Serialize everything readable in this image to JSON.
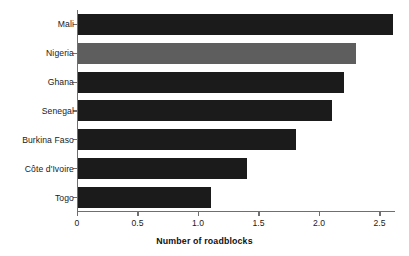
{
  "chart_data": {
    "type": "bar",
    "orientation": "horizontal",
    "title": "",
    "xlabel": "Number of roadblocks",
    "ylabel": "",
    "categories": [
      "Mali",
      "Nigeria",
      "Ghana",
      "Senegal",
      "Burkina Faso",
      "Côte d'Ivoire",
      "Togo"
    ],
    "values": [
      2.6,
      2.3,
      2.2,
      2.1,
      1.8,
      1.4,
      1.1
    ],
    "xlim": [
      0,
      2.62
    ],
    "xticks": [
      0,
      0.5,
      1.0,
      1.5,
      2.0,
      2.5
    ],
    "xtick_labels": [
      "0",
      "0.5",
      "1.0",
      "1.5",
      "2.0",
      "2.5"
    ],
    "grid": false,
    "legend": null,
    "bar_colors": [
      "#1b1b1b",
      "#5e5e5e",
      "#1b1b1b",
      "#1b1b1b",
      "#1b1b1b",
      "#1b1b1b",
      "#1b1b1b"
    ],
    "highlight_category": "Nigeria",
    "series": [
      {
        "name": "Number of roadblocks",
        "values": [
          2.6,
          2.3,
          2.2,
          2.1,
          1.8,
          1.4,
          1.1
        ]
      }
    ]
  },
  "colors": {
    "bar_dark": "#1b1b1b",
    "bar_gray": "#5e5e5e",
    "axis": "#6f6f6f",
    "text": "#1a1a1a",
    "background": "#ffffff"
  }
}
